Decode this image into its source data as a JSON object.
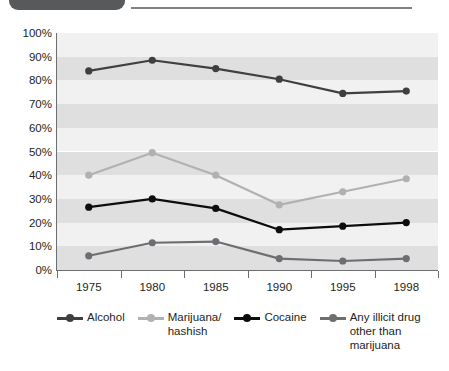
{
  "header": {
    "tab_icon": "rounded-tab-shape",
    "rule_icon": "horizontal-rule"
  },
  "chart_data": {
    "type": "line",
    "title": "",
    "subtitle": "",
    "xlabel": "",
    "ylabel": "",
    "categories": [
      "1975",
      "1980",
      "1985",
      "1990",
      "1995",
      "1998"
    ],
    "ylim": [
      0,
      100
    ],
    "ytick_labels": [
      "100%",
      "90%",
      "80%",
      "70%",
      "60%",
      "50%",
      "40%",
      "30%",
      "20%",
      "10%",
      "0%"
    ],
    "ytick_values": [
      100,
      90,
      80,
      70,
      60,
      50,
      40,
      30,
      20,
      10,
      0
    ],
    "grid": "horizontal alternating bands, 10% each",
    "legend_position": "bottom",
    "series": [
      {
        "name": "Alcohol",
        "label": "Alcohol",
        "color": "#3f3f41",
        "values": [
          84,
          88.5,
          85,
          80.5,
          74.5,
          75.5
        ]
      },
      {
        "name": "Marijuana/hashish",
        "label": "Marijuana/\nhashish",
        "color": "#b0b1b3",
        "values": [
          40,
          49.5,
          40,
          27.5,
          33,
          38.5
        ]
      },
      {
        "name": "Cocaine",
        "label": "Cocaine",
        "color": "#0d0d0d",
        "values": [
          26.5,
          30,
          26,
          17,
          18.5,
          20
        ]
      },
      {
        "name": "Any illicit drug other than marijuana",
        "label": "Any illicit drug\nother than\nmarijuana",
        "color": "#6d6e71",
        "values": [
          6,
          11.5,
          12,
          4.8,
          3.8,
          4.8
        ]
      }
    ]
  }
}
